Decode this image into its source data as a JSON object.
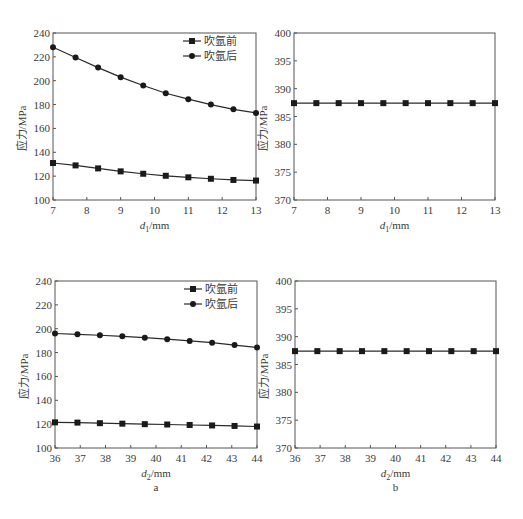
{
  "chart_data": [
    {
      "id": "top-left",
      "type": "line",
      "title": "",
      "xlabel": "d1/mm",
      "xlabel_main": "d",
      "xlabel_sub": "1",
      "xlabel_unit": "/mm",
      "ylabel": "应力/MPa",
      "xlim": [
        7,
        13
      ],
      "ylim": [
        100,
        240
      ],
      "xticks": [
        7,
        8,
        9,
        10,
        11,
        12,
        13
      ],
      "yticks": [
        100,
        120,
        140,
        160,
        180,
        200,
        220,
        240
      ],
      "grid": false,
      "legend_position": "upper right",
      "x": [
        7,
        7.667,
        8.333,
        9,
        9.667,
        10.333,
        11,
        11.667,
        12.333,
        13
      ],
      "series": [
        {
          "name": "吹氩前",
          "marker": "square",
          "values": [
            131,
            129,
            126.5,
            124,
            122,
            120.3,
            119,
            117.8,
            116.8,
            116.3
          ]
        },
        {
          "name": "吹氩后",
          "marker": "circle",
          "values": [
            228,
            219.5,
            211,
            203,
            196,
            189.5,
            184.5,
            180,
            176,
            173
          ]
        }
      ],
      "panel_label": ""
    },
    {
      "id": "top-right",
      "type": "line",
      "title": "",
      "xlabel": "d1/mm",
      "xlabel_main": "d",
      "xlabel_sub": "1",
      "xlabel_unit": "/mm",
      "ylabel": "应力/MPa",
      "xlim": [
        7,
        13
      ],
      "ylim": [
        370,
        400
      ],
      "xticks": [
        7,
        8,
        9,
        10,
        11,
        12,
        13
      ],
      "yticks": [
        370,
        375,
        380,
        385,
        390,
        395,
        400
      ],
      "grid": false,
      "x": [
        7,
        7.667,
        8.333,
        9,
        9.667,
        10.333,
        11,
        11.667,
        12.333,
        13
      ],
      "series": [
        {
          "name": "",
          "marker": "square",
          "values": [
            387.4,
            387.4,
            387.4,
            387.4,
            387.4,
            387.4,
            387.4,
            387.4,
            387.4,
            387.4
          ]
        }
      ],
      "panel_label": ""
    },
    {
      "id": "bottom-left",
      "type": "line",
      "title": "",
      "xlabel": "d2/mm",
      "xlabel_main": "d",
      "xlabel_sub": "2",
      "xlabel_unit": "/mm",
      "ylabel": "应力/MPa",
      "xlim": [
        36,
        44
      ],
      "ylim": [
        100,
        240
      ],
      "xticks": [
        36,
        37,
        38,
        39,
        40,
        41,
        42,
        43,
        44
      ],
      "yticks": [
        100,
        120,
        140,
        160,
        180,
        200,
        220,
        240
      ],
      "grid": false,
      "legend_position": "upper right",
      "x": [
        36,
        36.889,
        37.778,
        38.667,
        39.556,
        40.444,
        41.333,
        42.222,
        43.111,
        44
      ],
      "series": [
        {
          "name": "吹氩前",
          "marker": "square",
          "values": [
            121.5,
            121.3,
            120.8,
            120.4,
            120.0,
            119.7,
            119.3,
            118.9,
            118.5,
            118.0
          ]
        },
        {
          "name": "吹氩后",
          "marker": "circle",
          "values": [
            196,
            195.3,
            194.5,
            193.6,
            192.5,
            191.2,
            189.8,
            188.3,
            186.3,
            184.3
          ]
        }
      ],
      "panel_label": "a"
    },
    {
      "id": "bottom-right",
      "type": "line",
      "title": "",
      "xlabel": "d2/mm",
      "xlabel_main": "d",
      "xlabel_sub": "2",
      "xlabel_unit": "/mm",
      "ylabel": "应力/MPa",
      "xlim": [
        36,
        44
      ],
      "ylim": [
        370,
        400
      ],
      "xticks": [
        36,
        37,
        38,
        39,
        40,
        41,
        42,
        43,
        44
      ],
      "yticks": [
        370,
        375,
        380,
        385,
        390,
        395,
        400
      ],
      "grid": false,
      "x": [
        36,
        36.889,
        37.778,
        38.667,
        39.556,
        40.444,
        41.333,
        42.222,
        43.111,
        44
      ],
      "series": [
        {
          "name": "",
          "marker": "square",
          "values": [
            387.4,
            387.4,
            387.4,
            387.4,
            387.4,
            387.4,
            387.4,
            387.4,
            387.4,
            387.4
          ]
        }
      ],
      "panel_label": "b"
    }
  ],
  "layout": {
    "frames": [
      {
        "x0": 53,
        "x1": 256,
        "y0": 33,
        "y1": 200
      },
      {
        "x0": 294,
        "x1": 495,
        "y0": 33,
        "y1": 200
      },
      {
        "x0": 55,
        "x1": 257,
        "y0": 281,
        "y1": 448
      },
      {
        "x0": 295,
        "x1": 496,
        "y0": 281,
        "y1": 448
      }
    ],
    "line_color": "#2a2a2a",
    "axis_color": "#555555"
  }
}
